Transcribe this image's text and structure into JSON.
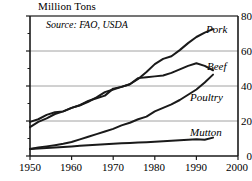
{
  "chart_data": {
    "type": "line",
    "title": "Million Tons",
    "subtitle": "Source: FAO, USDA",
    "xlabel": "",
    "ylabel": "Million Tons",
    "xlim": [
      1950,
      2000
    ],
    "ylim": [
      0,
      80
    ],
    "xticks": [
      1950,
      1960,
      1970,
      1980,
      1990,
      2000
    ],
    "yticks": [
      0,
      20,
      40,
      60,
      80
    ],
    "grid": true,
    "legend_position": "right-inline",
    "x": [
      1950,
      1952,
      1954,
      1956,
      1958,
      1960,
      1962,
      1964,
      1966,
      1968,
      1970,
      1972,
      1974,
      1976,
      1978,
      1980,
      1982,
      1984,
      1986,
      1988,
      1990,
      1992,
      1994
    ],
    "series": [
      {
        "name": "Pork",
        "values": [
          16.5,
          19.5,
          21.5,
          24.0,
          25.5,
          27.5,
          29.0,
          31.0,
          33.5,
          36.5,
          38.0,
          39.5,
          41.0,
          44.0,
          48.0,
          52.5,
          55.5,
          57.0,
          60.5,
          64.5,
          68.0,
          70.5,
          72.5
        ]
      },
      {
        "name": "Beef",
        "values": [
          19.5,
          21.0,
          23.5,
          25.0,
          25.5,
          27.5,
          29.0,
          31.5,
          33.0,
          34.5,
          38.5,
          39.5,
          41.0,
          44.5,
          45.0,
          45.5,
          46.0,
          47.5,
          49.5,
          51.5,
          53.0,
          51.5,
          49.0
        ]
      },
      {
        "name": "Poultry",
        "values": [
          4.0,
          4.8,
          5.5,
          6.2,
          7.0,
          8.0,
          9.5,
          11.0,
          12.5,
          14.0,
          15.5,
          17.5,
          19.0,
          21.0,
          22.5,
          25.5,
          27.5,
          29.5,
          32.0,
          35.0,
          38.0,
          42.0,
          46.5
        ]
      },
      {
        "name": "Mutton",
        "values": [
          4.0,
          4.3,
          4.6,
          4.9,
          5.2,
          5.5,
          5.8,
          6.1,
          6.4,
          6.7,
          7.0,
          7.3,
          7.5,
          7.7,
          7.9,
          8.1,
          8.4,
          8.7,
          9.0,
          9.3,
          9.6,
          9.3,
          10.5
        ]
      }
    ],
    "colors": {
      "line": "#1a1a1a",
      "grid": "#8c8c8c",
      "axis": "#1a1a1a",
      "background": "#ffffff"
    }
  }
}
